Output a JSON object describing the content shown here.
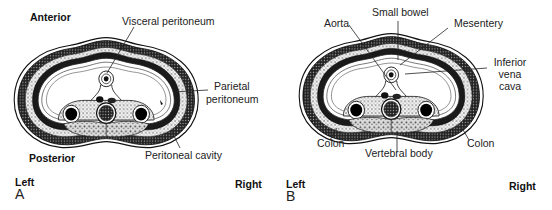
{
  "panels": [
    {
      "id": "A",
      "letter": "A",
      "orientation": {
        "anterior": "Anterior",
        "posterior": "Posterior",
        "left": "Left",
        "right": "Right"
      },
      "labels": {
        "visceral_peritoneum": "Visceral peritoneum",
        "parietal_peritoneum_1": "Parietal",
        "parietal_peritoneum_2": "peritoneum",
        "peritoneal_cavity": "Peritoneal cavity"
      }
    },
    {
      "id": "B",
      "letter": "B",
      "orientation": {
        "left": "Left",
        "right": "Right"
      },
      "labels": {
        "small_bowel": "Small bowel",
        "aorta": "Aorta",
        "mesentery": "Mesentery",
        "ivc_1": "Inferior",
        "ivc_2": "vena",
        "ivc_3": "cava",
        "colon_left": "Colon",
        "colon_right": "Colon",
        "vertebral_body": "Vertebral body"
      }
    }
  ]
}
